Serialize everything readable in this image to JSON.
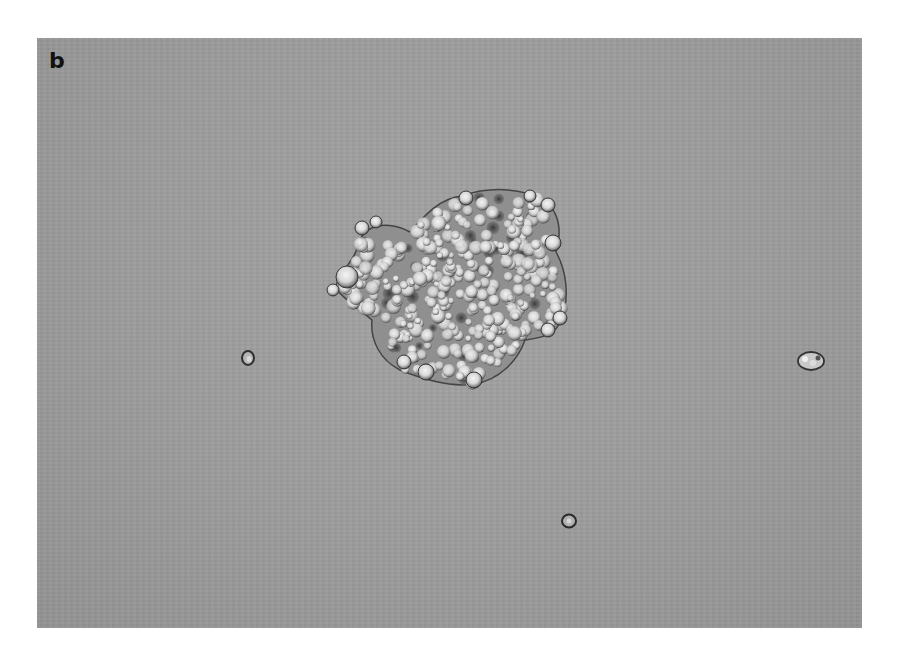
{
  "figure": {
    "panel_label": "b",
    "background_color": "#9c9c9c",
    "objects": [
      {
        "name": "cell-cluster",
        "type": "aggregate",
        "center": [
          455,
          290
        ],
        "approx_size": [
          235,
          195
        ]
      },
      {
        "name": "single-cell-1",
        "type": "single",
        "center": [
          248,
          358
        ],
        "radius": 7
      },
      {
        "name": "single-cell-2",
        "type": "single",
        "center": [
          811,
          361
        ],
        "radius": 12
      },
      {
        "name": "single-cell-3",
        "type": "single",
        "center": [
          569,
          521
        ],
        "radius": 8
      }
    ]
  }
}
